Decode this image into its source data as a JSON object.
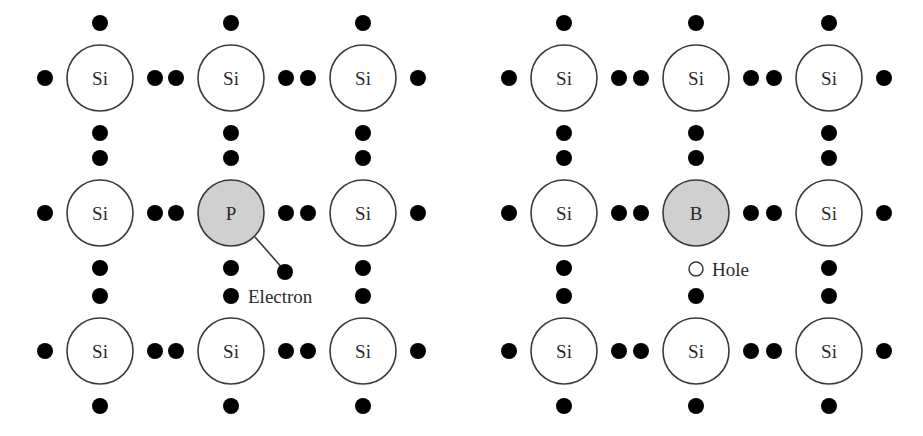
{
  "diagrams": [
    {
      "name": "n-type-lattice",
      "atoms": [
        [
          "Si",
          "Si",
          "Si"
        ],
        [
          "Si",
          "P",
          "Si"
        ],
        [
          "Si",
          "Si",
          "Si"
        ]
      ],
      "dopant": "P",
      "annotation": "Electron"
    },
    {
      "name": "p-type-lattice",
      "atoms": [
        [
          "Si",
          "Si",
          "Si"
        ],
        [
          "Si",
          "B",
          "Si"
        ],
        [
          "Si",
          "Si",
          "Si"
        ]
      ],
      "dopant": "B",
      "annotation": "Hole"
    }
  ],
  "labels": {
    "l_r0c0": "Si",
    "l_r0c1": "Si",
    "l_r0c2": "Si",
    "l_r1c0": "Si",
    "l_r1c1": "P",
    "l_r1c2": "Si",
    "l_r2c0": "Si",
    "l_r2c1": "Si",
    "l_r2c2": "Si",
    "r_r0c0": "Si",
    "r_r0c1": "Si",
    "r_r0c2": "Si",
    "r_r1c0": "Si",
    "r_r1c1": "B",
    "r_r1c2": "Si",
    "r_r2c0": "Si",
    "r_r2c1": "Si",
    "r_r2c2": "Si",
    "electron": "Electron",
    "hole": "Hole"
  },
  "colors": {
    "atom_fill": "#ffffff",
    "dopant_fill": "#d0d0d0",
    "electron_dot": "#000000",
    "outline": "#3a3a3a"
  }
}
